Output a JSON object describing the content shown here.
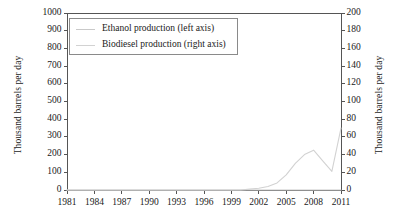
{
  "chart_data": {
    "type": "line",
    "title": "",
    "xlabel": "",
    "ylabel": "Thousand barrels per day",
    "ylabel_right": "Thousand barrels per day",
    "grid": false,
    "legend_position": "upper left inside plot",
    "xlim": [
      1981,
      2011
    ],
    "ylim": [
      0,
      1000
    ],
    "ylim_right": [
      0,
      200
    ],
    "xticks": [
      1981,
      1984,
      1987,
      1990,
      1993,
      1996,
      1999,
      2002,
      2005,
      2008,
      2011
    ],
    "xtick_labels": [
      "1981",
      "1984",
      "1987",
      "1990",
      "1993",
      "1996",
      "1999",
      "2002",
      "2005",
      "2008",
      "2011"
    ],
    "yticks_left": [
      0,
      100,
      200,
      300,
      400,
      500,
      600,
      700,
      800,
      900,
      1000
    ],
    "ytick_labels_left": [
      "0",
      "100",
      "200",
      "300",
      "400",
      "500",
      "600",
      "700",
      "800",
      "900",
      "1000"
    ],
    "yticks_right": [
      0,
      20,
      40,
      60,
      80,
      100,
      120,
      140,
      160,
      180,
      200
    ],
    "ytick_labels_right": [
      "0",
      "20",
      "40",
      "60",
      "80",
      "100",
      "120",
      "140",
      "160",
      "180",
      "200"
    ],
    "x": [
      1981,
      1982,
      1983,
      1984,
      1985,
      1986,
      1987,
      1988,
      1989,
      1990,
      1991,
      1992,
      1993,
      1994,
      1995,
      1996,
      1997,
      1998,
      1999,
      2000,
      2001,
      2002,
      2003,
      2004,
      2005,
      2006,
      2007,
      2008,
      2009,
      2010,
      2011
    ],
    "series": [
      {
        "name": "Ethanol production (left axis)",
        "axis": "left",
        "color": "#c9c9c9",
        "values": [
          0,
          0,
          0,
          0,
          0,
          0,
          0,
          0,
          0,
          0,
          0,
          0,
          0,
          0,
          0,
          0,
          0,
          0,
          0,
          0,
          0,
          0,
          0,
          0,
          0,
          0,
          0,
          0,
          0,
          0,
          0
        ]
      },
      {
        "name": "Biodiesel production (right axis)",
        "axis": "right",
        "color": "#d2d2d2",
        "values": [
          0,
          0,
          0,
          0,
          0,
          0,
          0,
          0,
          0,
          0,
          0,
          0,
          0,
          0,
          0,
          0,
          0,
          0,
          0,
          0,
          1,
          2,
          4,
          8,
          17,
          30,
          40,
          45,
          33,
          21,
          70
        ]
      }
    ],
    "legend": [
      {
        "label": "Ethanol production (left axis)",
        "color": "#c9c9c9"
      },
      {
        "label": "Biodiesel production (right axis)",
        "color": "#d2d2d2"
      }
    ],
    "axis_color": "#555555",
    "frame": {
      "left": 67,
      "right": 341,
      "top": 13,
      "bottom": 190
    }
  }
}
